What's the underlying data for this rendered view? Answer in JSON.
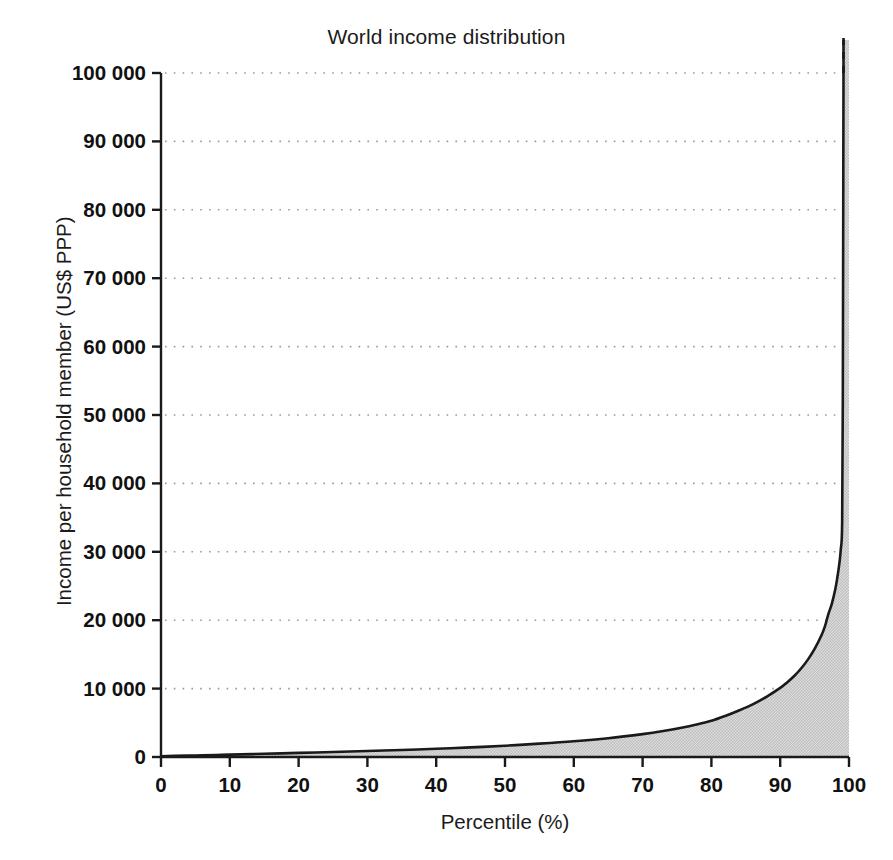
{
  "chart_data": {
    "type": "area",
    "title": "World income distribution",
    "xlabel": "Percentile (%)",
    "ylabel": "Income per household member (US$ PPP)",
    "xlim": [
      0,
      100
    ],
    "ylim": [
      0,
      100000
    ],
    "grid": "horizontal-dotted",
    "legend": "none",
    "x_ticks": [
      "0",
      "10",
      "20",
      "30",
      "40",
      "50",
      "60",
      "70",
      "80",
      "90",
      "100"
    ],
    "x_tick_values": [
      0,
      10,
      20,
      30,
      40,
      50,
      60,
      70,
      80,
      90,
      100
    ],
    "y_ticks": [
      "0",
      "10 000",
      "20 000",
      "30 000",
      "40 000",
      "50 000",
      "60 000",
      "70 000",
      "80 000",
      "90 000",
      "100 000"
    ],
    "y_tick_values": [
      0,
      10000,
      20000,
      30000,
      40000,
      50000,
      60000,
      70000,
      80000,
      90000,
      100000
    ],
    "series": [
      {
        "name": "Income per household member",
        "fill_color": "#cdcdcd",
        "line_color": "#1a1a1a",
        "x": [
          0,
          2,
          5,
          8,
          10,
          15,
          20,
          25,
          30,
          35,
          40,
          45,
          50,
          55,
          60,
          65,
          70,
          73,
          76,
          78,
          80,
          82,
          84,
          86,
          88,
          90,
          91,
          92,
          93,
          94,
          95,
          96,
          96.5,
          97,
          97.5,
          98,
          98.3,
          98.6,
          98.8,
          99,
          99.1,
          99.2
        ],
        "y": [
          120,
          160,
          230,
          300,
          350,
          470,
          600,
          740,
          880,
          1030,
          1200,
          1400,
          1650,
          1950,
          2300,
          2750,
          3350,
          3800,
          4350,
          4800,
          5300,
          6000,
          6800,
          7700,
          8800,
          10100,
          10900,
          11800,
          12900,
          14200,
          15800,
          17800,
          19100,
          20900,
          22400,
          24500,
          26200,
          28300,
          30300,
          34000,
          52000,
          100000
        ]
      }
    ],
    "annotations": [
      {
        "name": "top-truncation-dashed-line",
        "description": "Dashed vertical continuation of the income spike above the 100 000 axis maximum at roughly the 99th percentile",
        "x": 99.2,
        "y_from": 100000,
        "y_to": 108000,
        "style": "dashed"
      }
    ]
  },
  "axes": {
    "title": "World income distribution",
    "x_title": "Percentile (%)",
    "y_title": "Income per household member (US$ PPP)"
  },
  "colors": {
    "area_fill": "#cdcdcd",
    "curve_line": "#1a1a1a",
    "axis_line": "#1a1a1a",
    "gridline": "#9a9a9a",
    "text": "#1b1b1b",
    "background": "#ffffff"
  }
}
